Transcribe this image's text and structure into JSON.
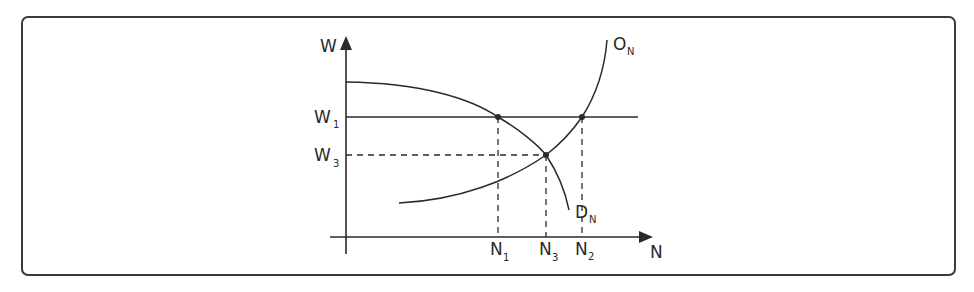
{
  "diagram": {
    "type": "supply-demand",
    "axes": {
      "y_label": "W",
      "x_label": "N"
    },
    "curves": {
      "supply": {
        "main": "O",
        "sub": "N"
      },
      "demand": {
        "main": "D",
        "sub": "N"
      }
    },
    "y_ticks": [
      {
        "main": "W",
        "sub": "1"
      },
      {
        "main": "W",
        "sub": "3"
      }
    ],
    "x_ticks": [
      {
        "main": "N",
        "sub": "1"
      },
      {
        "main": "N",
        "sub": "3"
      },
      {
        "main": "N",
        "sub": "2"
      }
    ],
    "colors": {
      "line": "#2a2a2a",
      "frame": "#3a3a3a"
    }
  }
}
